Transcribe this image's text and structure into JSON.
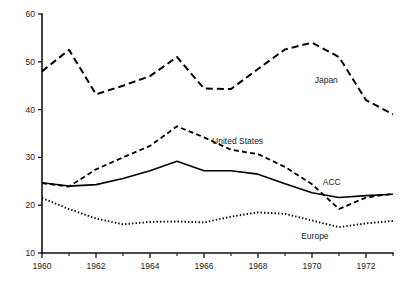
{
  "chart_data": {
    "type": "line",
    "title": "",
    "subtitle": "",
    "xlabel": "",
    "ylabel": "",
    "xlim": [
      1960,
      1973
    ],
    "ylim": [
      10,
      60
    ],
    "grid": false,
    "legend": "inline-annotations",
    "x": [
      1960,
      1961,
      1962,
      1963,
      1964,
      1965,
      1966,
      1967,
      1968,
      1969,
      1970,
      1971,
      1972,
      1973
    ],
    "y_ticks": [
      10,
      20,
      30,
      40,
      50,
      60
    ],
    "y_tick_labels": [
      "10",
      "20",
      "30",
      "40",
      "50",
      "60"
    ],
    "x_ticks_major": [
      1960,
      1962,
      1964,
      1966,
      1968,
      1970,
      1972
    ],
    "x_tick_labels": [
      "1960",
      "1962",
      "1964",
      "1966",
      "1968",
      "1970",
      "1972"
    ],
    "x_ticks_minor": [
      1961,
      1963,
      1965,
      1967,
      1969,
      1971,
      1973
    ],
    "series": [
      {
        "name": "Japan",
        "style": "long-dash",
        "label": "Japan",
        "label_x": 1970.1,
        "label_y": 45.5,
        "values": [
          48.0,
          52.5,
          43.2,
          45.0,
          47.0,
          51.0,
          44.4,
          44.3,
          48.5,
          52.6,
          54.0,
          51.0,
          42.0,
          39.0
        ]
      },
      {
        "name": "United States",
        "style": "short-dash",
        "label": "United States",
        "label_x": 1966.3,
        "label_y": 32.8,
        "values": [
          24.6,
          23.9,
          27.5,
          30.0,
          32.4,
          36.5,
          34.2,
          31.6,
          30.7,
          28.0,
          24.4,
          19.2,
          21.6,
          22.4
        ]
      },
      {
        "name": "ACC",
        "style": "solid",
        "label": "ACC",
        "label_x": 1970.4,
        "label_y": 24.2,
        "values": [
          24.7,
          24.0,
          24.3,
          25.6,
          27.2,
          29.2,
          27.2,
          27.2,
          26.5,
          24.5,
          22.6,
          21.6,
          22.0,
          22.3
        ]
      },
      {
        "name": "Europe",
        "style": "dotted",
        "label": "Europe",
        "label_x": 1969.6,
        "label_y": 12.9,
        "values": [
          21.5,
          19.2,
          17.2,
          16.0,
          16.5,
          16.6,
          16.4,
          17.6,
          18.5,
          18.2,
          16.8,
          15.4,
          16.2,
          16.7
        ]
      }
    ]
  }
}
